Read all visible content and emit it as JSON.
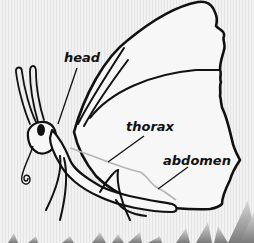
{
  "diagram": {
    "labels": [
      {
        "id": "head",
        "text": "head"
      },
      {
        "id": "thorax",
        "text": "thorax"
      },
      {
        "id": "abdomen",
        "text": "abdomen"
      }
    ],
    "colors": {
      "outline": "#111111",
      "body_fill": "#f7f7f7",
      "vein": "#b5b5b5",
      "grass": "#8c8c8c",
      "background": "#ececec"
    }
  }
}
